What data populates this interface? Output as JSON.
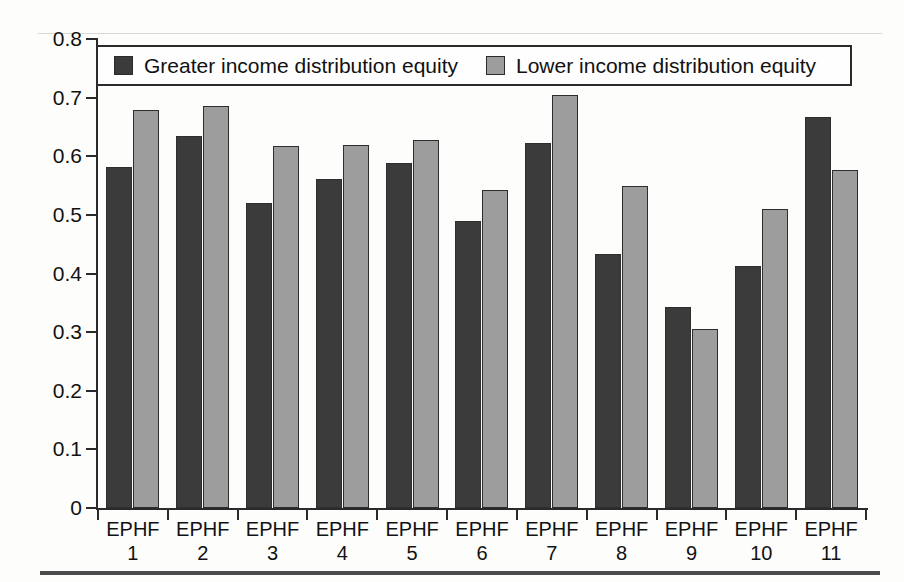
{
  "chart_data": {
    "type": "bar",
    "title": "",
    "subtitle": "",
    "xlabel": "",
    "ylabel": "",
    "ylim": [
      0,
      0.8
    ],
    "yticks": [
      "0",
      "0.1",
      "0.2",
      "0.3",
      "0.4",
      "0.5",
      "0.6",
      "0.7",
      "0.8"
    ],
    "ytick_values": [
      0,
      0.1,
      0.2,
      0.3,
      0.4,
      0.5,
      0.6,
      0.7,
      0.8
    ],
    "grid": false,
    "legend_position": "top-center-inside",
    "categories": [
      "EPHF 1",
      "EPHF 2",
      "EPHF 3",
      "EPHF 4",
      "EPHF 5",
      "EPHF 6",
      "EPHF 7",
      "EPHF 8",
      "EPHF 9",
      "EPHF 10",
      "EPHF 11"
    ],
    "category_lines": [
      {
        "line1": "EPHF",
        "line2": "1"
      },
      {
        "line1": "EPHF",
        "line2": "2"
      },
      {
        "line1": "EPHF",
        "line2": "3"
      },
      {
        "line1": "EPHF",
        "line2": "4"
      },
      {
        "line1": "EPHF",
        "line2": "5"
      },
      {
        "line1": "EPHF",
        "line2": "6"
      },
      {
        "line1": "EPHF",
        "line2": "7"
      },
      {
        "line1": "EPHF",
        "line2": "8"
      },
      {
        "line1": "EPHF",
        "line2": "9"
      },
      {
        "line1": "EPHF",
        "line2": "10"
      },
      {
        "line1": "EPHF",
        "line2": "11"
      }
    ],
    "series": [
      {
        "name": "Greater income distribution equity",
        "color": "#3b3b3b",
        "values": [
          0.581,
          0.634,
          0.521,
          0.561,
          0.589,
          0.49,
          0.623,
          0.433,
          0.343,
          0.413,
          0.667
        ]
      },
      {
        "name": "Lower income distribution equity",
        "color": "#9d9d9d",
        "values": [
          0.679,
          0.685,
          0.617,
          0.619,
          0.627,
          0.542,
          0.704,
          0.549,
          0.306,
          0.51,
          0.577
        ]
      }
    ]
  },
  "legend": {
    "entries": [
      {
        "label": "Greater income distribution equity",
        "swatch": "dark"
      },
      {
        "label": "Lower income distribution equity",
        "swatch": "light"
      }
    ]
  },
  "colors": {
    "series_dark": "#3b3b3b",
    "series_light": "#9d9d9d",
    "axis": "#2b2b2b",
    "rule": "#4a4a4a",
    "background": "#fdfdfc"
  }
}
